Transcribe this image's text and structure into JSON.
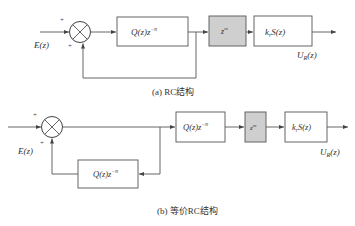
{
  "diagram_a": {
    "caption": "(a) RC结构",
    "input_label": "E(z)",
    "output_label": "U",
    "output_sub": "R",
    "output_arg": "(z)",
    "sum_signs": [
      "+",
      "+"
    ],
    "blocks": [
      {
        "id": "q_block",
        "main": "Q(z)z",
        "sup": "−N",
        "shaded": false
      },
      {
        "id": "zm_block",
        "main": "z",
        "sup": "m",
        "shaded": true
      },
      {
        "id": "krs_block",
        "main_k": "k",
        "sub_r": "r",
        "main_s": "S(z)",
        "shaded": false
      }
    ]
  },
  "diagram_b": {
    "caption": "(b) 等价RC结构",
    "input_label": "E(z)",
    "output_label": "U",
    "output_sub": "R",
    "output_arg": "(z)",
    "sum_signs": [
      "+",
      "+"
    ],
    "blocks": [
      {
        "id": "feedback_q_block",
        "main": "Q(z)z",
        "sup": "−N",
        "shaded": false
      },
      {
        "id": "q_block",
        "main": "Q(z)z",
        "sup": "−N",
        "shaded": false
      },
      {
        "id": "zm_block",
        "main": "z",
        "sup": "m",
        "shaded": true
      },
      {
        "id": "krs_block",
        "main_k": "k",
        "sub_r": "r",
        "main_s": "S(z)",
        "shaded": false
      }
    ]
  },
  "colors": {
    "line": "#555555",
    "shaded_fill": "#cfcfcf",
    "background": "#ffffff"
  }
}
